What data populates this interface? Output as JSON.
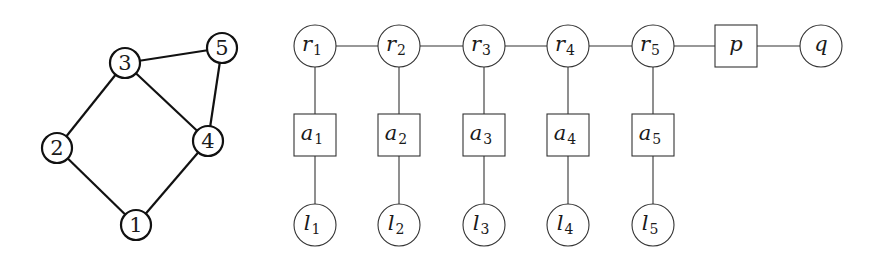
{
  "left_graph": {
    "nodes": [
      {
        "id": "1",
        "label": "1",
        "x": 136,
        "y": 225
      },
      {
        "id": "2",
        "label": "2",
        "x": 57,
        "y": 148
      },
      {
        "id": "3",
        "label": "3",
        "x": 125,
        "y": 63
      },
      {
        "id": "4",
        "label": "4",
        "x": 208,
        "y": 141
      },
      {
        "id": "5",
        "label": "5",
        "x": 222,
        "y": 48
      }
    ],
    "edges": [
      [
        "3",
        "5"
      ],
      [
        "3",
        "2"
      ],
      [
        "3",
        "4"
      ],
      [
        "5",
        "4"
      ],
      [
        "2",
        "1"
      ],
      [
        "4",
        "1"
      ]
    ],
    "node_radius": 15
  },
  "right_graph": {
    "r_nodes": [
      {
        "base": "r",
        "sub": "1",
        "shape": "circle",
        "x": 315,
        "y": 46
      },
      {
        "base": "r",
        "sub": "2",
        "shape": "circle",
        "x": 399,
        "y": 46
      },
      {
        "base": "r",
        "sub": "3",
        "shape": "circle",
        "x": 484,
        "y": 46
      },
      {
        "base": "r",
        "sub": "4",
        "shape": "circle",
        "x": 568,
        "y": 46
      },
      {
        "base": "r",
        "sub": "5",
        "shape": "circle",
        "x": 653,
        "y": 46
      }
    ],
    "a_nodes": [
      {
        "base": "a",
        "sub": "1",
        "shape": "square",
        "x": 315,
        "y": 135
      },
      {
        "base": "a",
        "sub": "2",
        "shape": "square",
        "x": 399,
        "y": 135
      },
      {
        "base": "a",
        "sub": "3",
        "shape": "square",
        "x": 484,
        "y": 135
      },
      {
        "base": "a",
        "sub": "4",
        "shape": "square",
        "x": 568,
        "y": 135
      },
      {
        "base": "a",
        "sub": "5",
        "shape": "square",
        "x": 653,
        "y": 135
      }
    ],
    "l_nodes": [
      {
        "base": "l",
        "sub": "1",
        "shape": "circle",
        "x": 315,
        "y": 225
      },
      {
        "base": "l",
        "sub": "2",
        "shape": "circle",
        "x": 399,
        "y": 225
      },
      {
        "base": "l",
        "sub": "3",
        "shape": "circle",
        "x": 484,
        "y": 225
      },
      {
        "base": "l",
        "sub": "4",
        "shape": "circle",
        "x": 568,
        "y": 225
      },
      {
        "base": "l",
        "sub": "5",
        "shape": "circle",
        "x": 653,
        "y": 225
      }
    ],
    "p_node": {
      "base": "p",
      "sub": "",
      "shape": "square",
      "x": 736,
      "y": 46
    },
    "q_node": {
      "base": "q",
      "sub": "",
      "shape": "circle",
      "x": 821,
      "y": 46
    },
    "circle_radius": 21,
    "square_half": 21
  }
}
